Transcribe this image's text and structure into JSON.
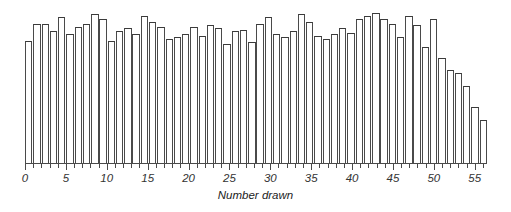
{
  "chart_data": {
    "type": "bar",
    "title": "",
    "subtitle": "",
    "xlabel": "Number drawn",
    "ylabel": "",
    "xlim": [
      0,
      56.5
    ],
    "ylim": [
      0,
      100
    ],
    "grid": false,
    "legend": null,
    "tick_labels": [
      "0",
      "5",
      "10",
      "15",
      "20",
      "25",
      "30",
      "35",
      "40",
      "45",
      "50",
      "55"
    ],
    "tick_values": [
      0,
      5,
      10,
      15,
      20,
      25,
      30,
      35,
      40,
      45,
      50,
      55
    ],
    "minor_tick_step": 1,
    "bar_fill": "#ffffff",
    "bar_edge": "#3f3f3f",
    "axis_color": "#4a4a4a",
    "categories": [
      1,
      2,
      3,
      4,
      5,
      6,
      7,
      8,
      9,
      10,
      11,
      12,
      13,
      14,
      15,
      16,
      17,
      18,
      19,
      20,
      21,
      22,
      23,
      24,
      25,
      26,
      27,
      28,
      29,
      30,
      31,
      32,
      33,
      34,
      35,
      36,
      37,
      38,
      39,
      40,
      41,
      42,
      43,
      44,
      45,
      46,
      47,
      48,
      49,
      50,
      51,
      52,
      53,
      54,
      55,
      56
    ],
    "values": [
      79,
      90,
      90,
      85,
      94,
      83,
      88,
      90,
      96,
      93,
      79,
      85,
      87,
      83,
      95,
      91,
      88,
      80,
      81,
      83,
      88,
      82,
      89,
      87,
      77,
      85,
      86,
      78,
      90,
      94,
      83,
      81,
      85,
      96,
      91,
      82,
      80,
      83,
      87,
      84,
      93,
      95,
      97,
      93,
      90,
      81,
      95,
      89,
      75,
      93,
      68,
      60,
      58,
      50,
      36,
      28
    ]
  }
}
